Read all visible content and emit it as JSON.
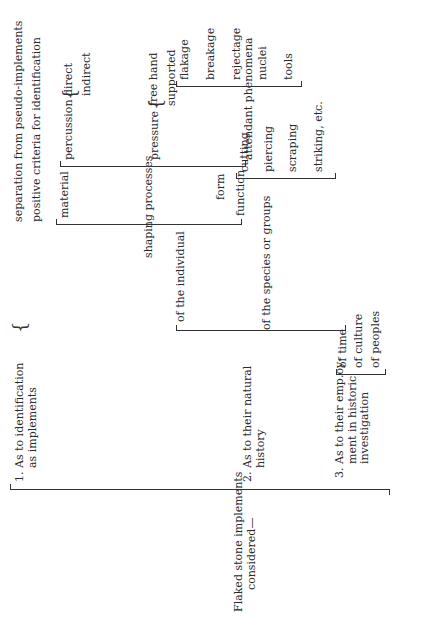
{
  "document": {
    "orientation": "rotated-90-ccw",
    "root": {
      "label": "Flaked stone implements considered—"
    },
    "branches": [
      {
        "label": "1. As to identification as implements",
        "children": [
          {
            "label": "separation from pseudo-implements"
          },
          {
            "label": "positive criteria for identification"
          }
        ]
      },
      {
        "label": "2. As to their natural history",
        "children": [
          {
            "label": "of the individual",
            "children": [
              {
                "label": "material"
              },
              {
                "label": "shaping processes",
                "children": [
                  {
                    "label": "percussion",
                    "children": [
                      {
                        "label": "direct"
                      },
                      {
                        "label": "indirect"
                      }
                    ]
                  },
                  {
                    "label": "pressure",
                    "children": [
                      {
                        "label": "free hand"
                      },
                      {
                        "label": "supported"
                      }
                    ]
                  },
                  {
                    "label": "attendant phenomena",
                    "children": [
                      {
                        "label": "flakage"
                      },
                      {
                        "label": "breakage"
                      },
                      {
                        "label": "rejectage"
                      },
                      {
                        "label": "nuclei"
                      },
                      {
                        "label": "tools"
                      }
                    ]
                  }
                ]
              },
              {
                "label": "form"
              },
              {
                "label": "function",
                "children": [
                  {
                    "label": "cutting"
                  },
                  {
                    "label": "piercing"
                  },
                  {
                    "label": "scraping"
                  },
                  {
                    "label": "striking, etc."
                  }
                ]
              }
            ]
          },
          {
            "label": "of the species or groups"
          }
        ]
      },
      {
        "label": "3. As to their emp.oy- ment in historic investigation",
        "children": [
          {
            "label": "of time"
          },
          {
            "label": "of culture"
          },
          {
            "label": "of peoples"
          }
        ]
      }
    ]
  },
  "labels": {
    "root_l1": "Flaked stone implements",
    "root_l2": "considered—",
    "b1_l1": "1. As to identification",
    "b1_l2": "as implements",
    "b1_c1": "separation from pseudo-implements",
    "b1_c2": "positive criteria for identification",
    "b2_l1": "2. As to their natural",
    "b2_l2": "history",
    "ind": "of the individual",
    "species": "of the species or groups",
    "material": "material",
    "shaping": "shaping processes",
    "form": "form",
    "function": "function",
    "percussion": "percussion",
    "direct": "direct",
    "indirect": "indirect",
    "pressure": "pressure",
    "freehand": "free hand",
    "supported": "supported",
    "attendant": "attendant phenomena",
    "flakage": "flakage",
    "breakage": "breakage",
    "rejectage": "rejectage",
    "nuclei": "nuclei",
    "tools": "tools",
    "cutting": "cutting",
    "piercing": "piercing",
    "scraping": "scraping",
    "striking": "striking, etc.",
    "b3_l1": "3. As to their emp.oy-",
    "b3_l2": "ment in historic",
    "b3_l3": "investigation",
    "time": "of time",
    "culture": "of culture",
    "peoples": "of peoples"
  }
}
